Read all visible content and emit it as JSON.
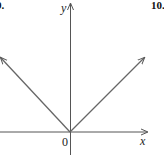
{
  "problem_numbers": {
    "left": "9.",
    "right": "10."
  },
  "axes": {
    "x_label": "x",
    "y_label": "y",
    "origin_label": "0"
  },
  "graph": {
    "description": "V-shaped graph with vertex at origin, two rays upward-left and upward-right",
    "line_color": "#666666",
    "axis_color": "#555555"
  }
}
